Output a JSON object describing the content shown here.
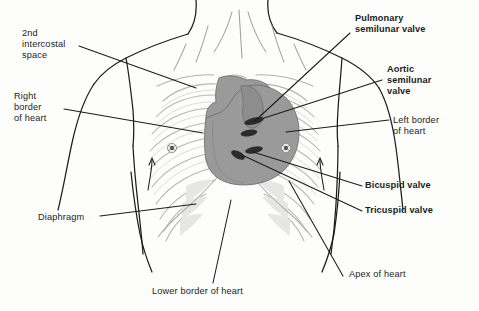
{
  "figure": {
    "type": "anatomical-diagram",
    "background_color": "#fdfdfc",
    "colors": {
      "outline": "#1c1c1c",
      "ribcage": "#b9b9b9",
      "ribcage_fill": "#f2f2f0",
      "heart_fill": "#9a9a9a",
      "heart_outline": "#6f6f6f",
      "valve_marking": "#2b2b2b",
      "leader_line": "#1c1c1c",
      "text": "#1c1c1c"
    }
  },
  "labels": [
    {
      "id": "second-intercostal-space",
      "text_lines": [
        "2nd",
        "intercostal",
        "space"
      ],
      "x": 22,
      "y": 28,
      "align": "left",
      "bold": false,
      "leader": {
        "x1": 79,
        "y1": 46,
        "x2": 196,
        "y2": 88
      }
    },
    {
      "id": "right-border-of-heart",
      "text_lines": [
        "Right",
        "border",
        "of heart"
      ],
      "x": 14,
      "y": 91,
      "align": "left",
      "bold": false,
      "leader": {
        "x1": 64,
        "y1": 109,
        "x2": 203,
        "y2": 133
      }
    },
    {
      "id": "diaphragm",
      "text_lines": [
        "Diaphragm"
      ],
      "x": 38,
      "y": 212,
      "align": "left",
      "bold": false,
      "leader": {
        "x1": 100,
        "y1": 216,
        "x2": 196,
        "y2": 204
      }
    },
    {
      "id": "lower-border-of-heart",
      "text_lines": [
        "Lower border of heart"
      ],
      "x": 152,
      "y": 286,
      "align": "left",
      "bold": false,
      "leader": {
        "x1": 213,
        "y1": 283,
        "x2": 231,
        "y2": 200
      }
    },
    {
      "id": "apex-of-heart",
      "text_lines": [
        "Apex of heart"
      ],
      "x": 345,
      "y": 272,
      "align": "left",
      "bold": false,
      "leader": {
        "x1": 343,
        "y1": 276,
        "x2": 289,
        "y2": 181
      }
    },
    {
      "id": "pulmonary-semilunar-valve",
      "text_lines": [
        "Pulmonary",
        "semilunar valve"
      ],
      "x": 355,
      "y": 13,
      "align": "left",
      "bold": true,
      "leader": {
        "x1": 350,
        "y1": 33,
        "x2": 255,
        "y2": 121
      }
    },
    {
      "id": "aortic-semilunar-valve",
      "text_lines": [
        "Aortic",
        "semilunar",
        "valve"
      ],
      "x": 387,
      "y": 64,
      "align": "left",
      "bold": true,
      "leader": {
        "x1": 382,
        "y1": 80,
        "x2": 261,
        "y2": 119
      }
    },
    {
      "id": "left-border-of-heart",
      "text_lines": [
        "Left border",
        "of heart"
      ],
      "x": 393,
      "y": 115,
      "align": "left",
      "bold": false,
      "leader": {
        "x1": 389,
        "y1": 120,
        "x2": 286,
        "y2": 132
      }
    },
    {
      "id": "bicuspid-valve",
      "text_lines": [
        "Bicuspid valve"
      ],
      "x": 365,
      "y": 182,
      "align": "left",
      "bold": true,
      "leader": {
        "x1": 362,
        "y1": 186,
        "x2": 253,
        "y2": 152
      }
    },
    {
      "id": "tricuspid-valve",
      "text_lines": [
        "Tricuspid valve"
      ],
      "x": 365,
      "y": 207,
      "align": "left",
      "bold": true,
      "leader": {
        "x1": 362,
        "y1": 211,
        "x2": 242,
        "y2": 155
      }
    }
  ],
  "anatomy": {
    "body_outline": "torso with neck, shoulders and upper arms",
    "ribcage": "anterior rib cage, clavicles and sternum",
    "heart": "gray heart silhouette projected on sternum and left chest",
    "nipples": [
      {
        "id": "nipple-right",
        "cx": 172,
        "cy": 148
      },
      {
        "id": "nipple-left",
        "cx": 286,
        "cy": 148
      }
    ],
    "valve_markings": [
      {
        "id": "pulmonary-valve-marking",
        "cx": 254,
        "cy": 121
      },
      {
        "id": "aortic-valve-marking",
        "cx": 259,
        "cy": 130
      },
      {
        "id": "bicuspid-valve-marking",
        "cx": 252,
        "cy": 151
      },
      {
        "id": "tricuspid-valve-marking",
        "cx": 240,
        "cy": 155
      }
    ]
  }
}
